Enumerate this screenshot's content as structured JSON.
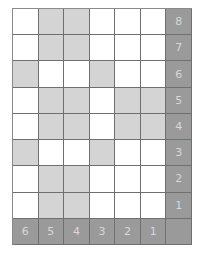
{
  "grid": {
    "rows": [
      {
        "label": "8",
        "cells": [
          "w",
          "g",
          "g",
          "w",
          "w",
          "w"
        ]
      },
      {
        "label": "7",
        "cells": [
          "w",
          "g",
          "g",
          "w",
          "w",
          "w"
        ]
      },
      {
        "label": "6",
        "cells": [
          "g",
          "w",
          "w",
          "g",
          "w",
          "w"
        ]
      },
      {
        "label": "5",
        "cells": [
          "w",
          "g",
          "g",
          "w",
          "g",
          "g"
        ]
      },
      {
        "label": "4",
        "cells": [
          "w",
          "g",
          "g",
          "w",
          "g",
          "g"
        ]
      },
      {
        "label": "3",
        "cells": [
          "g",
          "w",
          "w",
          "g",
          "w",
          "w"
        ]
      },
      {
        "label": "2",
        "cells": [
          "w",
          "g",
          "g",
          "w",
          "w",
          "w"
        ]
      },
      {
        "label": "1",
        "cells": [
          "w",
          "g",
          "g",
          "w",
          "w",
          "w"
        ]
      }
    ],
    "column_labels": [
      "6",
      "5",
      "4",
      "3",
      "2",
      "1"
    ],
    "corner_label": ""
  },
  "colors": {
    "white": "#ffffff",
    "light_gray": "#d4d4d4",
    "dark_gray": "#9a9a9a",
    "grid_line": "#6f6f6f",
    "label_text": "#d8d8d8"
  }
}
